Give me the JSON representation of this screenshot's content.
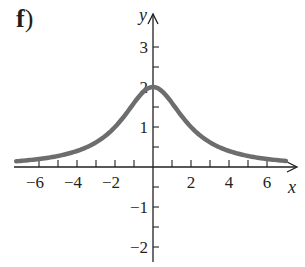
{
  "panel": {
    "label": "f",
    "paren": ")"
  },
  "chart_data": {
    "type": "line",
    "title": "",
    "xlabel": "x",
    "ylabel": "y",
    "xlim": [
      -7,
      7
    ],
    "ylim": [
      -2.3,
      3.5
    ],
    "grid": false,
    "legend": null,
    "x_ticks": [
      -6,
      -5,
      -4,
      -3,
      -2,
      -1,
      1,
      2,
      3,
      4,
      5,
      6
    ],
    "x_tick_labels": [
      "-6",
      "-4",
      "-2",
      "2",
      "4",
      "6"
    ],
    "x_tick_label_values": [
      -6,
      -4,
      -2,
      2,
      4,
      6
    ],
    "y_ticks": [
      -2,
      -1.5,
      -1,
      -0.5,
      0.5,
      1,
      1.5,
      2,
      2.5,
      3
    ],
    "y_tick_labels": [
      "3",
      "2",
      "1",
      "-1",
      "-2"
    ],
    "y_tick_label_values": [
      3,
      2,
      1,
      -1,
      -2
    ],
    "series": [
      {
        "name": "f(x)",
        "description": "Symmetric bell-shaped curve peaking at (0,2), approaching 0 as |x| grows",
        "color": "#6d6d6d",
        "x": [
          -7,
          -6,
          -5,
          -4,
          -3,
          -2,
          -1,
          0,
          1,
          2,
          3,
          4,
          5,
          6,
          7
        ],
        "y": [
          0.15,
          0.2,
          0.28,
          0.4,
          0.62,
          1.0,
          1.6,
          2.0,
          1.6,
          1.0,
          0.62,
          0.4,
          0.28,
          0.2,
          0.15
        ]
      }
    ],
    "colors": {
      "curve": "#6d6d6d",
      "axes": "#231f20"
    }
  }
}
